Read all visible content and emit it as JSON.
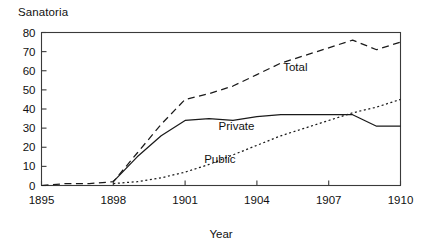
{
  "chart_data": {
    "type": "line",
    "title": "",
    "subtitle": "",
    "xlabel": "Year",
    "ylabel": "Sanatoria",
    "xlim": [
      1895,
      1910
    ],
    "ylim": [
      0,
      80
    ],
    "xticks": [
      1895,
      1898,
      1901,
      1904,
      1907,
      1910
    ],
    "xtick_labels": [
      "1895",
      "1898",
      "1901",
      "1904",
      "1907",
      "1910"
    ],
    "yticks": [
      0,
      10,
      20,
      30,
      40,
      50,
      60,
      70,
      80
    ],
    "ytick_labels": [
      "0",
      "10",
      "20",
      "30",
      "40",
      "50",
      "60",
      "70",
      "80"
    ],
    "grid": false,
    "legend_position": "inline-annotations",
    "x": [
      1895,
      1896,
      1897,
      1898,
      1899,
      1900,
      1901,
      1902,
      1903,
      1904,
      1905,
      1906,
      1907,
      1908,
      1909,
      1910
    ],
    "series": [
      {
        "name": "Total",
        "style": "dashed",
        "label_text": "Total",
        "values": [
          0,
          1,
          1,
          2,
          17,
          32,
          45,
          48,
          52,
          58,
          64,
          68,
          72,
          76,
          71,
          75
        ]
      },
      {
        "name": "Private",
        "style": "solid",
        "label_text": "Private",
        "values": [
          null,
          null,
          null,
          2,
          15,
          26,
          34,
          35,
          34,
          36,
          37,
          37,
          37,
          37,
          31,
          31
        ]
      },
      {
        "name": "Public",
        "style": "dotted",
        "label_text": "Public",
        "values": [
          null,
          null,
          null,
          1,
          2,
          4,
          7,
          11,
          16,
          21,
          26,
          30,
          34,
          38,
          41,
          45
        ]
      }
    ],
    "annotations": [
      {
        "text": "Total",
        "x": 1905.1,
        "y": 62
      },
      {
        "text": "Private",
        "x": 1902.4,
        "y": 31
      },
      {
        "text": "Public",
        "x": 1901.8,
        "y": 14
      }
    ],
    "colors": {
      "axis": "#3a3a3a",
      "series": "#1a1a1a",
      "background": "#ffffff"
    }
  }
}
